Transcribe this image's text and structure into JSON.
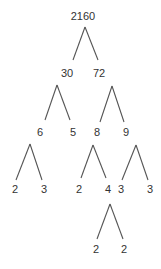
{
  "diagram": {
    "type": "factor-tree",
    "root": "2160",
    "nodes": [
      {
        "id": "n2160",
        "label": "2160",
        "x": 83,
        "y": 20
      },
      {
        "id": "n30",
        "label": "30",
        "x": 67,
        "y": 77
      },
      {
        "id": "n72",
        "label": "72",
        "x": 99,
        "y": 77
      },
      {
        "id": "n6",
        "label": "6",
        "x": 40,
        "y": 136
      },
      {
        "id": "n5",
        "label": "5",
        "x": 73,
        "y": 136
      },
      {
        "id": "n8",
        "label": "8",
        "x": 97,
        "y": 136
      },
      {
        "id": "n9",
        "label": "9",
        "x": 126,
        "y": 136
      },
      {
        "id": "n2a",
        "label": "2",
        "x": 15,
        "y": 193
      },
      {
        "id": "n3a",
        "label": "3",
        "x": 44,
        "y": 193
      },
      {
        "id": "n2b",
        "label": "2",
        "x": 79,
        "y": 193
      },
      {
        "id": "n4",
        "label": "4",
        "x": 108,
        "y": 193
      },
      {
        "id": "n3b",
        "label": "3",
        "x": 121,
        "y": 193
      },
      {
        "id": "n3c",
        "label": "3",
        "x": 150,
        "y": 193
      },
      {
        "id": "n2c",
        "label": "2",
        "x": 96,
        "y": 253
      },
      {
        "id": "n2d",
        "label": "2",
        "x": 124,
        "y": 253
      }
    ],
    "edges": [
      {
        "from": "n2160",
        "to": "n30",
        "x1": 85,
        "y1": 27,
        "x2": 73,
        "y2": 60
      },
      {
        "from": "n2160",
        "to": "n72",
        "x1": 85,
        "y1": 27,
        "x2": 98,
        "y2": 60
      },
      {
        "from": "n30",
        "to": "n6",
        "x1": 57,
        "y1": 85,
        "x2": 45,
        "y2": 120
      },
      {
        "from": "n30",
        "to": "n5",
        "x1": 57,
        "y1": 85,
        "x2": 70,
        "y2": 120
      },
      {
        "from": "n72",
        "to": "n8",
        "x1": 112,
        "y1": 86,
        "x2": 100,
        "y2": 122
      },
      {
        "from": "n72",
        "to": "n9",
        "x1": 112,
        "y1": 86,
        "x2": 124,
        "y2": 122
      },
      {
        "from": "n6",
        "to": "n2a",
        "x1": 30,
        "y1": 144,
        "x2": 16,
        "y2": 180
      },
      {
        "from": "n6",
        "to": "n3a",
        "x1": 30,
        "y1": 144,
        "x2": 42,
        "y2": 180
      },
      {
        "from": "n8",
        "to": "n2b",
        "x1": 93,
        "y1": 145,
        "x2": 81,
        "y2": 178
      },
      {
        "from": "n8",
        "to": "n4",
        "x1": 93,
        "y1": 145,
        "x2": 106,
        "y2": 178
      },
      {
        "from": "n9",
        "to": "n3b",
        "x1": 136,
        "y1": 145,
        "x2": 122,
        "y2": 180
      },
      {
        "from": "n9",
        "to": "n3c",
        "x1": 136,
        "y1": 145,
        "x2": 148,
        "y2": 180
      },
      {
        "from": "n4",
        "to": "n2c",
        "x1": 110,
        "y1": 204,
        "x2": 97,
        "y2": 239
      },
      {
        "from": "n4",
        "to": "n2d",
        "x1": 110,
        "y1": 204,
        "x2": 123,
        "y2": 239
      }
    ]
  }
}
